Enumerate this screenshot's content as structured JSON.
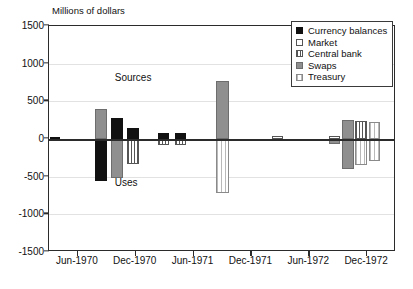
{
  "chart_data": {
    "type": "bar",
    "title": "Millions of dollars",
    "xlabel": "",
    "ylabel": "Millions of dollars",
    "ylim": [
      -1500,
      1500
    ],
    "yticks": [
      1500,
      1000,
      500,
      0,
      -500,
      -1000,
      -1500
    ],
    "xticks": [
      "Jun-1970",
      "Dec-1970",
      "Jun-1971",
      "Dec-1971",
      "Jun-1972",
      "Dec-1972"
    ],
    "grid": true,
    "legend_position": "top-right",
    "annotations": [
      {
        "text": "Sources",
        "x": "Dec-1970",
        "y": 800
      },
      {
        "text": "Uses",
        "x": "Dec-1970",
        "y": -600
      }
    ],
    "legend": [
      {
        "name": "Currency balances",
        "swatch": "solid-black"
      },
      {
        "name": "Market",
        "swatch": "open-white"
      },
      {
        "name": "Central bank",
        "swatch": "vertical-hatch"
      },
      {
        "name": "Swaps",
        "swatch": "solid-gray"
      },
      {
        "name": "Treasury",
        "swatch": "light-vertical-hatch"
      }
    ],
    "series": [
      {
        "name": "Currency balances",
        "style": "s-currency"
      },
      {
        "name": "Market",
        "style": "s-market"
      },
      {
        "name": "Central bank",
        "style": "s-central"
      },
      {
        "name": "Swaps",
        "style": "s-swaps"
      },
      {
        "name": "Treasury",
        "style": "s-treasury"
      }
    ],
    "bars": [
      {
        "series": "Currency balances",
        "x_frac": 0.018,
        "value": 30,
        "width_frac": 0.03
      },
      {
        "series": "Swaps",
        "x_frac": 0.15,
        "value": 400,
        "width_frac": 0.035
      },
      {
        "series": "Currency balances",
        "x_frac": 0.15,
        "value": -560,
        "width_frac": 0.035
      },
      {
        "series": "Currency balances",
        "x_frac": 0.196,
        "value": 275,
        "width_frac": 0.035
      },
      {
        "series": "Swaps",
        "x_frac": 0.196,
        "value": -520,
        "width_frac": 0.035
      },
      {
        "series": "Currency balances",
        "x_frac": 0.243,
        "value": 150,
        "width_frac": 0.035
      },
      {
        "series": "Central bank",
        "x_frac": 0.243,
        "value": -330,
        "width_frac": 0.035
      },
      {
        "series": "Currency balances",
        "x_frac": 0.33,
        "value": 80,
        "width_frac": 0.032
      },
      {
        "series": "Central bank",
        "x_frac": 0.33,
        "value": -85,
        "width_frac": 0.032
      },
      {
        "series": "Currency balances",
        "x_frac": 0.38,
        "value": 80,
        "width_frac": 0.032
      },
      {
        "series": "Central bank",
        "x_frac": 0.38,
        "value": -80,
        "width_frac": 0.032
      },
      {
        "series": "Swaps",
        "x_frac": 0.5,
        "value": 770,
        "width_frac": 0.04
      },
      {
        "series": "Treasury",
        "x_frac": 0.5,
        "value": -720,
        "width_frac": 0.04
      },
      {
        "series": "Market",
        "x_frac": 0.658,
        "value": 40,
        "width_frac": 0.032
      },
      {
        "series": "Market",
        "x_frac": 0.822,
        "value": 40,
        "width_frac": 0.032
      },
      {
        "series": "Swaps",
        "x_frac": 0.822,
        "value": -70,
        "width_frac": 0.032
      },
      {
        "series": "Swaps",
        "x_frac": 0.862,
        "value": 255,
        "width_frac": 0.034
      },
      {
        "series": "Swaps",
        "x_frac": 0.862,
        "value": -400,
        "width_frac": 0.034
      },
      {
        "series": "Central bank",
        "x_frac": 0.9,
        "value": 240,
        "width_frac": 0.034
      },
      {
        "series": "Treasury",
        "x_frac": 0.9,
        "value": -340,
        "width_frac": 0.034
      },
      {
        "series": "Treasury",
        "x_frac": 0.938,
        "value": 225,
        "width_frac": 0.034
      },
      {
        "series": "Treasury",
        "x_frac": 0.938,
        "value": -290,
        "width_frac": 0.034
      }
    ]
  }
}
